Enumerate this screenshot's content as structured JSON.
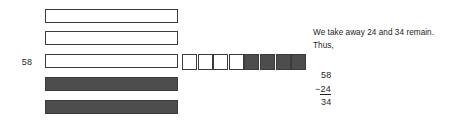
{
  "diagram": {
    "title_label": "58",
    "total_label": "58",
    "rods": [
      {
        "name": "rod-1",
        "filled": false,
        "value": 10
      },
      {
        "name": "rod-2",
        "filled": false,
        "value": 10
      },
      {
        "name": "rod-3",
        "filled": false,
        "value": 10
      },
      {
        "name": "rod-4",
        "filled": true,
        "value": 10
      },
      {
        "name": "rod-5",
        "filled": true,
        "value": 10
      }
    ],
    "units": [
      {
        "name": "unit-1",
        "filled": false
      },
      {
        "name": "unit-2",
        "filled": false
      },
      {
        "name": "unit-3",
        "filled": false
      },
      {
        "name": "unit-4",
        "filled": false
      },
      {
        "name": "unit-5",
        "filled": true
      },
      {
        "name": "unit-6",
        "filled": true
      },
      {
        "name": "unit-7",
        "filled": true
      },
      {
        "name": "unit-8",
        "filled": true
      }
    ],
    "colors": {
      "fill_dark": "#4d4d4d",
      "outline": "#3b3b3b",
      "fill_light": "#ffffff",
      "text": "#231f20"
    }
  },
  "explanation": {
    "line1": "We take away 24 and 34 remain.",
    "line2": "Thus,"
  },
  "arithmetic": {
    "minuend": "58",
    "operator": "−",
    "subtrahend": "24",
    "difference": "34"
  }
}
